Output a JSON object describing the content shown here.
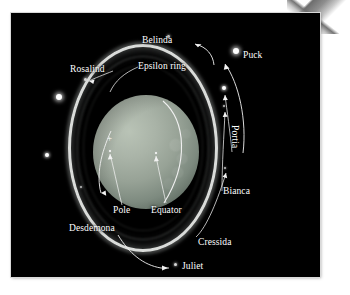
{
  "figure": {
    "kind": "astronomical-photograph",
    "background_color": "#000000",
    "page_color": "#ffffff"
  },
  "labels": {
    "belinda": "Belinda",
    "puck": "Puck",
    "epsilon_ring": "Epsilon ring",
    "rosalind": "Rosalind",
    "portia": "Portia",
    "bianca": "Bianca",
    "pole": "Pole",
    "equator": "Equator",
    "desdemona": "Desdemona",
    "cressida": "Cressida",
    "juliet": "Juliet"
  },
  "annotations": [
    {
      "name": "belinda",
      "label": "Belinda",
      "type": "moon",
      "x": 157,
      "y": 31
    },
    {
      "name": "puck",
      "label": "Puck",
      "type": "moon",
      "x": 236,
      "y": 46
    },
    {
      "name": "rosalind",
      "label": "Rosalind",
      "type": "moon",
      "x": 75,
      "y": 76
    },
    {
      "name": "portia",
      "label": "Portia",
      "type": "moon",
      "x": 229,
      "y": 97
    },
    {
      "name": "bianca",
      "label": "Bianca",
      "type": "moon",
      "x": 226,
      "y": 119
    },
    {
      "name": "cressida",
      "label": "Cressida",
      "type": "moon",
      "x": 230,
      "y": 200
    },
    {
      "name": "juliet",
      "label": "Juliet",
      "type": "moon",
      "x": 174,
      "y": 272
    },
    {
      "name": "desdemona",
      "label": "Desdemona",
      "type": "moon",
      "x": 74,
      "y": 229
    },
    {
      "name": "epsilon-ring",
      "label": "Epsilon ring",
      "type": "ring",
      "x": 140,
      "y": 65
    },
    {
      "name": "pole",
      "label": "Pole",
      "type": "feature",
      "x": 142,
      "y": 207
    },
    {
      "name": "equator",
      "label": "Equator",
      "type": "feature",
      "x": 186,
      "y": 213
    }
  ],
  "unlabeled_moons": [
    {
      "name": "unlabeled-moon-upper-left",
      "x": 63,
      "y": 106
    },
    {
      "name": "unlabeled-moon-lower-left",
      "x": 49,
      "y": 166
    }
  ],
  "colors": {
    "label_text": "#ffffff",
    "planet_disc": "#9aa59a",
    "epsilon_ring": "#eceeec",
    "sky": "#000000"
  }
}
